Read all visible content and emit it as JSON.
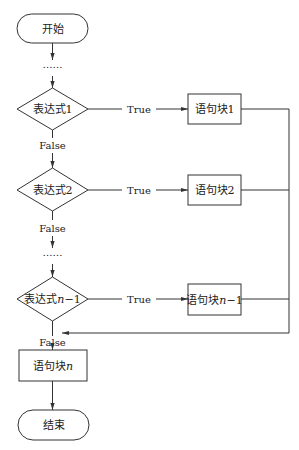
{
  "diagram": {
    "type": "flowchart",
    "nodes": {
      "start": "开始",
      "ellipsis_top": "……",
      "cond1": "表达式1",
      "block1": "语句块1",
      "cond2": "表达式2",
      "block2": "语句块2",
      "ellipsis_mid": "……",
      "cond_n1_prefix": "表达式",
      "cond_n1_var": "n",
      "cond_n1_suffix": "−1",
      "block_n1_prefix": "语句块",
      "block_n1_var": "n",
      "block_n1_suffix": "−1",
      "block_n_prefix": "语句块",
      "block_n_var": "n",
      "end": "结束"
    },
    "edge_labels": {
      "true1": "True",
      "true2": "True",
      "true_n1": "True",
      "false1": "False",
      "false2": "False",
      "false_n1": "False"
    },
    "colors": {
      "stroke": "#333333",
      "background": "#ffffff",
      "text": "#222222"
    }
  }
}
